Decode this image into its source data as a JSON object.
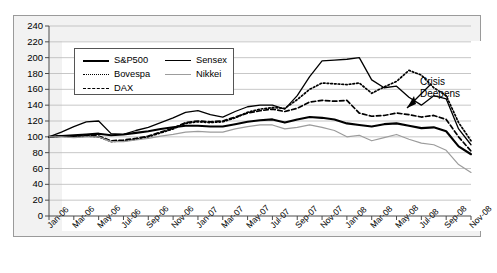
{
  "chart_data": {
    "type": "line",
    "title": "",
    "subtitle": "",
    "xlabel": "",
    "ylabel": "",
    "ylim": [
      0,
      240
    ],
    "ytick_step": 20,
    "yticks": [
      0,
      20,
      40,
      60,
      80,
      100,
      120,
      140,
      160,
      180,
      200,
      220,
      240
    ],
    "grid": "horizontal",
    "legend_position": "top-left-inside",
    "index_base": 100,
    "x": [
      "Jan-06",
      "Feb-06",
      "Mar-06",
      "Apr-06",
      "May-06",
      "Jun-06",
      "Jul-06",
      "Aug-06",
      "Sep-06",
      "Oct-06",
      "Nov-06",
      "Dec-06",
      "Jan-07",
      "Feb-07",
      "Mar-07",
      "Apr-07",
      "May-07",
      "Jun-07",
      "Jul-07",
      "Aug-07",
      "Sep-07",
      "Oct-07",
      "Nov-07",
      "Dec-07",
      "Jan-08",
      "Feb-08",
      "Mar-08",
      "Apr-08",
      "May-08",
      "Jun-08",
      "Jul-08",
      "Aug-08",
      "Sep-08",
      "Oct-08",
      "Nov-08"
    ],
    "xtick_labels": [
      "Jan-06",
      "Mar-06",
      "May-06",
      "Jul-06",
      "Sep-06",
      "Nov-06",
      "Jan-07",
      "Mar-07",
      "May-07",
      "Jul-07",
      "Sep-07",
      "Nov-07",
      "Jan-08",
      "Mar-08",
      "May-08",
      "Jul-08",
      "Sep-08",
      "Nov-08"
    ],
    "series": [
      {
        "name": "S&P500",
        "style": "solid-thick",
        "color": "#000000",
        "values": [
          100,
          101,
          102,
          103,
          104,
          102,
          103,
          105,
          107,
          110,
          112,
          114,
          114,
          113,
          113,
          116,
          119,
          121,
          122,
          118,
          122,
          125,
          124,
          122,
          117,
          115,
          113,
          116,
          117,
          114,
          111,
          112,
          107,
          88,
          78
        ]
      },
      {
        "name": "Sensex",
        "style": "solid-thin",
        "color": "#000000",
        "values": [
          100,
          106,
          113,
          119,
          120,
          104,
          103,
          108,
          112,
          118,
          124,
          131,
          133,
          128,
          125,
          132,
          138,
          140,
          140,
          135,
          152,
          176,
          196,
          197,
          198,
          200,
          172,
          162,
          164,
          150,
          140,
          152,
          148,
          110,
          90
        ]
      },
      {
        "name": "Bovespa",
        "style": "dotted",
        "color": "#000000",
        "values": [
          100,
          101,
          100,
          101,
          100,
          94,
          95,
          97,
          100,
          105,
          110,
          117,
          119,
          118,
          119,
          124,
          131,
          135,
          137,
          136,
          147,
          160,
          168,
          167,
          166,
          168,
          155,
          163,
          170,
          184,
          178,
          162,
          152,
          118,
          95
        ]
      },
      {
        "name": "DAX",
        "style": "dashed",
        "color": "#000000",
        "values": [
          100,
          101,
          101,
          102,
          101,
          95,
          96,
          98,
          101,
          106,
          111,
          118,
          120,
          119,
          120,
          125,
          130,
          133,
          135,
          132,
          136,
          144,
          146,
          145,
          146,
          130,
          126,
          127,
          130,
          128,
          125,
          127,
          122,
          100,
          82
        ]
      },
      {
        "name": "Nikkei",
        "style": "solid-gray",
        "color": "#9c9c9c",
        "values": [
          100,
          100,
          99,
          100,
          100,
          94,
          94,
          96,
          98,
          101,
          103,
          106,
          107,
          106,
          106,
          110,
          113,
          115,
          115,
          110,
          112,
          115,
          112,
          108,
          100,
          102,
          95,
          99,
          103,
          97,
          92,
          90,
          83,
          65,
          55
        ]
      }
    ],
    "annotations": [
      {
        "text_line1": "Crisis",
        "text_line2": "Deepens",
        "points_to": "Sensex near Sep-08"
      }
    ]
  }
}
